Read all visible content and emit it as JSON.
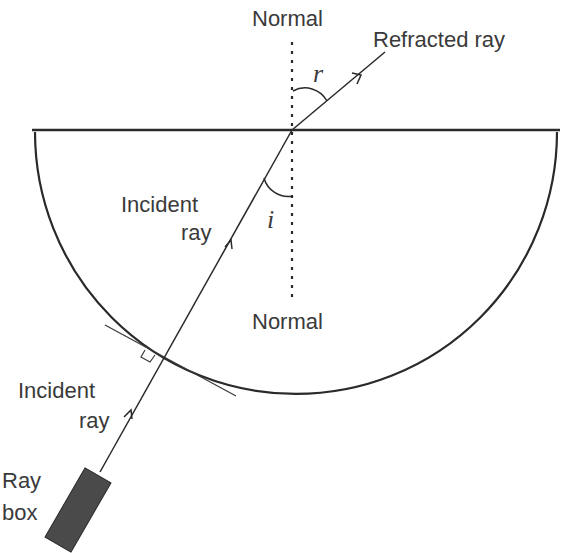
{
  "diagram": {
    "labels": {
      "normal_top": "Normal",
      "normal_bottom": "Normal",
      "refracted_ray": "Refracted ray",
      "incident_ray_upper_line1": "Incident",
      "incident_ray_upper_line2": "ray",
      "incident_ray_lower_line1": "Incident",
      "incident_ray_lower_line2": "ray",
      "ray_box_line1": "Ray",
      "ray_box_line2": "box",
      "angle_refraction": "r",
      "angle_incidence": "i"
    },
    "colors": {
      "line": "#2a2a2a",
      "text": "#3a3a3a",
      "ray_box_fill": "#4a4a4a"
    }
  }
}
